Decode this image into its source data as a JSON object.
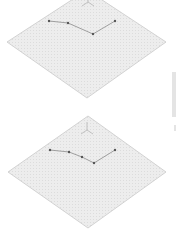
{
  "panels": [
    {
      "name": "isometric-plane-top",
      "diamond": [
        [
          87,
          -10
        ],
        [
          166,
          42
        ],
        [
          87,
          98
        ],
        [
          7,
          42
        ]
      ],
      "fill": "#ececec",
      "stroke": "#c9c9c9",
      "axis_glyph": {
        "x": 88,
        "y": 2,
        "visible": "partial"
      },
      "path": [
        [
          49,
          21
        ],
        [
          68,
          23
        ],
        [
          93,
          34
        ],
        [
          115,
          21
        ]
      ]
    },
    {
      "name": "isometric-plane-bottom",
      "diamond": [
        [
          88,
          116
        ],
        [
          166,
          172
        ],
        [
          88,
          228
        ],
        [
          8,
          172
        ]
      ],
      "fill": "#ececec",
      "stroke": "#c9c9c9",
      "axis_glyph": {
        "x": 87,
        "y": 130,
        "visible": "full"
      },
      "path": [
        [
          50,
          150
        ],
        [
          69,
          152
        ],
        [
          82,
          157
        ],
        [
          94,
          163
        ],
        [
          115,
          150
        ]
      ]
    }
  ],
  "colors": {
    "line": "#8a8a8a",
    "point": "#555555",
    "grid": "#dedede"
  }
}
